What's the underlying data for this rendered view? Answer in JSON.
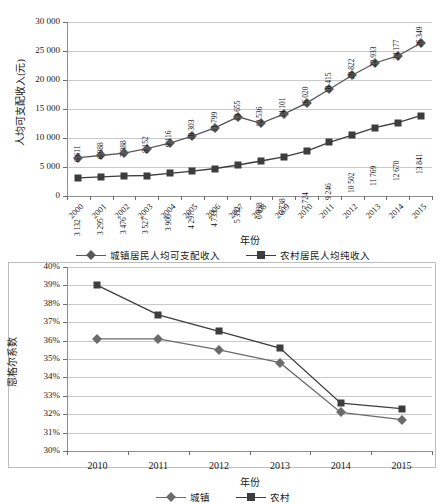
{
  "chart_data": [
    {
      "id": "income-chart",
      "type": "line",
      "title": "",
      "xlabel": "年份",
      "ylabel": "人均可支配收入(元)",
      "categories": [
        "2000",
        "2001",
        "2002",
        "2003",
        "2004",
        "2005",
        "2006",
        "2007",
        "2008",
        "2009",
        "2010",
        "2011",
        "2012",
        "2013",
        "2014",
        "2015"
      ],
      "ylim": [
        0,
        30000
      ],
      "ytick_labels": [
        "0",
        "5 000",
        "10 000",
        "15 000",
        "20 000",
        "25 000",
        "30 000"
      ],
      "ytick_values": [
        0,
        5000,
        10000,
        15000,
        20000,
        25000,
        30000
      ],
      "grid": true,
      "legend_position": "bottom",
      "series": [
        {
          "name": "城镇居民人均可支配收入",
          "marker": "diamond",
          "color": "#595959",
          "values": [
            6611,
            6988,
            7388,
            8152,
            9116,
            10303,
            11799,
            13655,
            12536,
            14101,
            16020,
            18415,
            20822,
            22933,
            24177,
            26349
          ],
          "labels": [
            "6 611",
            "6 988",
            "7 388",
            "8 152",
            "9 116",
            "10 303",
            "11 799",
            "13 655",
            "12 536",
            "14 101",
            "16 020",
            "18 415",
            "20 822",
            "22 933",
            "24 177",
            "26 349"
          ]
        },
        {
          "name": "农村居民人均纯收入",
          "marker": "square",
          "color": "#3d3d3d",
          "values": [
            3132,
            3295,
            3476,
            3527,
            3906,
            4297,
            4733,
            5352,
            6038,
            6738,
            7724,
            9246,
            10502,
            11769,
            12670,
            13841
          ],
          "labels": [
            "3 132",
            "3 295",
            "3 476",
            "3 527",
            "3 906",
            "4 297",
            "4 733",
            "5 352",
            "6 038",
            "6 738",
            "7 724",
            "9 246",
            "10 502",
            "11 769",
            "12 670",
            "13 841"
          ]
        }
      ]
    },
    {
      "id": "engel-chart",
      "type": "line",
      "title": "",
      "xlabel": "年份",
      "ylabel": "恩格尔系数",
      "categories": [
        "2010",
        "2011",
        "2012",
        "2013",
        "2014",
        "2015"
      ],
      "ylim": [
        30,
        40
      ],
      "ytick_labels": [
        "30%",
        "31%",
        "32%",
        "33%",
        "34%",
        "35%",
        "36%",
        "37%",
        "38%",
        "39%",
        "40%"
      ],
      "ytick_values": [
        30,
        31,
        32,
        33,
        34,
        35,
        36,
        37,
        38,
        39,
        40
      ],
      "grid": true,
      "legend_position": "bottom",
      "series": [
        {
          "name": "城镇",
          "marker": "diamond",
          "color": "#6b6b6b",
          "values": [
            36.1,
            36.1,
            35.5,
            34.8,
            32.1,
            31.7
          ]
        },
        {
          "name": "农村",
          "marker": "square",
          "color": "#3d3d3d",
          "values": [
            39.0,
            37.4,
            36.5,
            35.6,
            32.6,
            32.3
          ]
        }
      ]
    }
  ]
}
